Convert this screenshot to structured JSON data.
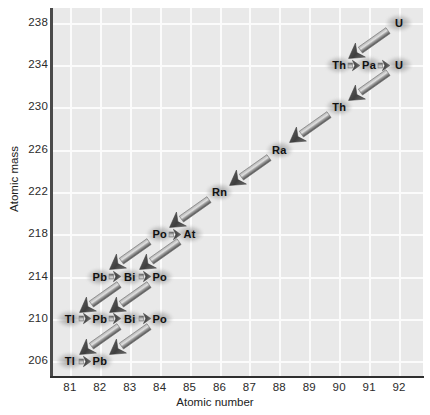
{
  "figure": {
    "xaxis_title": "Atomic number",
    "yaxis_title": "Atomic mass"
  },
  "chart_data": {
    "type": "scatter",
    "title": "",
    "xlabel": "Atomic number",
    "ylabel": "Atomic mass",
    "xlim": [
      80.4,
      92.8
    ],
    "ylim": [
      204.6,
      239.4
    ],
    "xticks": [
      81,
      82,
      83,
      84,
      85,
      86,
      87,
      88,
      89,
      90,
      91,
      92
    ],
    "yticks": [
      206,
      210,
      214,
      218,
      222,
      226,
      230,
      234,
      238
    ],
    "grid": true,
    "legend": "none",
    "nodes": [
      {
        "label": "U",
        "z": 92,
        "mass": 238
      },
      {
        "label": "Th",
        "z": 90,
        "mass": 234
      },
      {
        "label": "Pa",
        "z": 91,
        "mass": 234
      },
      {
        "label": "U",
        "z": 92,
        "mass": 234
      },
      {
        "label": "Th",
        "z": 90,
        "mass": 230
      },
      {
        "label": "Ra",
        "z": 88,
        "mass": 226
      },
      {
        "label": "Rn",
        "z": 86,
        "mass": 222
      },
      {
        "label": "Po",
        "z": 84,
        "mass": 218
      },
      {
        "label": "At",
        "z": 85,
        "mass": 218
      },
      {
        "label": "Pb",
        "z": 82,
        "mass": 214
      },
      {
        "label": "Bi",
        "z": 83,
        "mass": 214
      },
      {
        "label": "Po",
        "z": 84,
        "mass": 214
      },
      {
        "label": "Tl",
        "z": 81,
        "mass": 210
      },
      {
        "label": "Pb",
        "z": 82,
        "mass": 210
      },
      {
        "label": "Bi",
        "z": 83,
        "mass": 210
      },
      {
        "label": "Po",
        "z": 84,
        "mass": 210
      },
      {
        "label": "Tl",
        "z": 81,
        "mass": 206
      },
      {
        "label": "Pb",
        "z": 82,
        "mass": 206
      }
    ],
    "decays": [
      {
        "kind": "alpha",
        "from_z": 92,
        "from_mass": 238,
        "to_z": 90,
        "to_mass": 234
      },
      {
        "kind": "beta",
        "from_z": 90,
        "from_mass": 234,
        "to_z": 91,
        "to_mass": 234
      },
      {
        "kind": "beta",
        "from_z": 91,
        "from_mass": 234,
        "to_z": 92,
        "to_mass": 234
      },
      {
        "kind": "alpha",
        "from_z": 92,
        "from_mass": 234,
        "to_z": 90,
        "to_mass": 230
      },
      {
        "kind": "alpha",
        "from_z": 90,
        "from_mass": 230,
        "to_z": 88,
        "to_mass": 226
      },
      {
        "kind": "alpha",
        "from_z": 88,
        "from_mass": 226,
        "to_z": 86,
        "to_mass": 222
      },
      {
        "kind": "alpha",
        "from_z": 86,
        "from_mass": 222,
        "to_z": 84,
        "to_mass": 218
      },
      {
        "kind": "beta",
        "from_z": 84,
        "from_mass": 218,
        "to_z": 85,
        "to_mass": 218
      },
      {
        "kind": "alpha",
        "from_z": 84,
        "from_mass": 218,
        "to_z": 82,
        "to_mass": 214
      },
      {
        "kind": "alpha",
        "from_z": 85,
        "from_mass": 218,
        "to_z": 83,
        "to_mass": 214
      },
      {
        "kind": "beta",
        "from_z": 82,
        "from_mass": 214,
        "to_z": 83,
        "to_mass": 214
      },
      {
        "kind": "beta",
        "from_z": 83,
        "from_mass": 214,
        "to_z": 84,
        "to_mass": 214
      },
      {
        "kind": "alpha",
        "from_z": 83,
        "from_mass": 214,
        "to_z": 81,
        "to_mass": 210
      },
      {
        "kind": "alpha",
        "from_z": 84,
        "from_mass": 214,
        "to_z": 82,
        "to_mass": 210
      },
      {
        "kind": "beta",
        "from_z": 81,
        "from_mass": 210,
        "to_z": 82,
        "to_mass": 210
      },
      {
        "kind": "beta",
        "from_z": 82,
        "from_mass": 210,
        "to_z": 83,
        "to_mass": 210
      },
      {
        "kind": "beta",
        "from_z": 83,
        "from_mass": 210,
        "to_z": 84,
        "to_mass": 210
      },
      {
        "kind": "alpha",
        "from_z": 83,
        "from_mass": 210,
        "to_z": 81,
        "to_mass": 206
      },
      {
        "kind": "alpha",
        "from_z": 84,
        "from_mass": 210,
        "to_z": 82,
        "to_mass": 206
      },
      {
        "kind": "beta",
        "from_z": 81,
        "from_mass": 206,
        "to_z": 82,
        "to_mass": 206
      }
    ]
  },
  "colors": {
    "plot_background": "#e9e9e9",
    "gridline": "#fbfbfb",
    "axis": "#2f2f2f",
    "text": "#111111",
    "arrow_dark": "#4d4d4d",
    "arrow_light": "#e0e0e0"
  }
}
